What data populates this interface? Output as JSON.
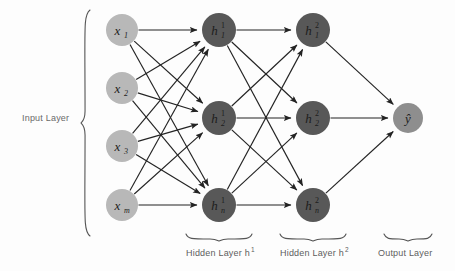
{
  "figure": {
    "background_color": "#fdfdfd",
    "edge_color": "#232323",
    "input_node_color": "#b8b8b8",
    "hidden_node_color": "#585858",
    "output_node_color": "#8e8e8e",
    "caption_color": "#5d5d5d"
  },
  "layers": [
    {
      "id": "input",
      "caption": "Input Layer",
      "caption_position": "left",
      "node_color": "#b8b8b8",
      "center_x": 122,
      "nodes": [
        {
          "base": "x",
          "sub": "1",
          "sup": "",
          "cx": 122,
          "cy": 30,
          "r": 16
        },
        {
          "base": "x",
          "sub": "2",
          "sup": "",
          "cx": 122,
          "cy": 88,
          "r": 16
        },
        {
          "base": "x",
          "sub": "3",
          "sup": "",
          "cx": 122,
          "cy": 146,
          "r": 16
        },
        {
          "base": "x",
          "sub": "m",
          "sup": "",
          "cx": 122,
          "cy": 205,
          "r": 16
        }
      ]
    },
    {
      "id": "hidden1",
      "caption": "Hidden Layer h",
      "caption_sup": "1",
      "caption_position": "bottom",
      "caption_x": 219,
      "node_color": "#585858",
      "center_x": 219,
      "nodes": [
        {
          "base": "h",
          "sub": "1",
          "sup": "1",
          "cx": 219,
          "cy": 30,
          "r": 17
        },
        {
          "base": "h",
          "sub": "2",
          "sup": "1",
          "cx": 219,
          "cy": 118,
          "r": 17
        },
        {
          "base": "h",
          "sub": "n",
          "sup": "1",
          "cx": 219,
          "cy": 205,
          "r": 17
        }
      ]
    },
    {
      "id": "hidden2",
      "caption": "Hidden Layer h",
      "caption_sup": "2",
      "caption_position": "bottom",
      "caption_x": 313,
      "node_color": "#585858",
      "center_x": 313,
      "nodes": [
        {
          "base": "h",
          "sub": "1",
          "sup": "2",
          "cx": 313,
          "cy": 30,
          "r": 17
        },
        {
          "base": "h",
          "sub": "2",
          "sup": "2",
          "cx": 313,
          "cy": 118,
          "r": 17
        },
        {
          "base": "h",
          "sub": "n",
          "sup": "2",
          "cx": 313,
          "cy": 205,
          "r": 17
        }
      ]
    },
    {
      "id": "output",
      "caption": "Output Layer",
      "caption_position": "bottom",
      "caption_x": 408,
      "node_color": "#8e8e8e",
      "center_x": 408,
      "nodes": [
        {
          "base": "ŷ",
          "sub": "",
          "sup": "",
          "cx": 408,
          "cy": 118,
          "r": 15
        }
      ]
    }
  ],
  "connections": [
    {
      "from_layer": "input",
      "to_layer": "hidden1",
      "pattern": "fully-connected",
      "count": 12
    },
    {
      "from_layer": "hidden1",
      "to_layer": "hidden2",
      "pattern": "fully-connected",
      "count": 9
    },
    {
      "from_layer": "hidden2",
      "to_layer": "output",
      "pattern": "fully-connected",
      "count": 3
    }
  ],
  "braces": [
    {
      "id": "input-brace",
      "orientation": "vertical",
      "x": 90,
      "y_start": 10,
      "y_end": 236,
      "label": "Input Layer"
    },
    {
      "id": "hidden1-brace",
      "orientation": "horizontal",
      "x_start": 186,
      "x_end": 252,
      "y": 234,
      "label": "Hidden Layer h1"
    },
    {
      "id": "hidden2-brace",
      "orientation": "horizontal",
      "x_start": 280,
      "x_end": 346,
      "y": 234,
      "label": "Hidden Layer h2"
    },
    {
      "id": "output-brace",
      "orientation": "horizontal",
      "x_start": 384,
      "x_end": 432,
      "y": 234,
      "label": "Output Layer"
    }
  ],
  "captions": {
    "input": "Input Layer",
    "hidden1": "Hidden Layer h",
    "hidden1_sup": "1",
    "hidden2": "Hidden Layer h",
    "hidden2_sup": "2",
    "output": "Output Layer"
  }
}
